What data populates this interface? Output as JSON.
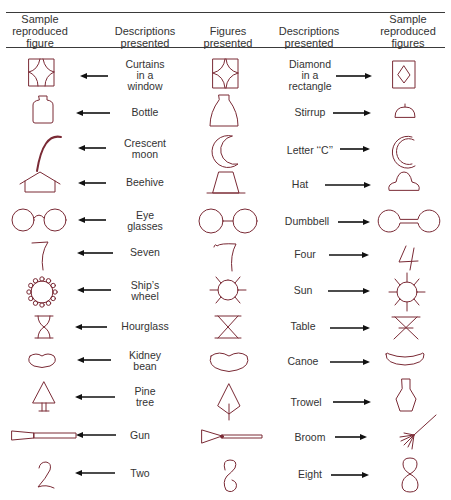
{
  "header": {
    "col1": "Sample\nreproduced\nfigure",
    "col2": "Descriptions\npresented",
    "col3": "Figures\npresented",
    "col4": "Descriptions\npresented",
    "col5": "Sample\nreproduced\nfigures"
  },
  "colors": {
    "figure_stroke": "#7a2a35",
    "arrow": "#111111",
    "rule": "#3a3a3a"
  },
  "rows": [
    {
      "left_desc": "Curtains\nin a\nwindow",
      "figure": "curtains-window-figure",
      "left_reproduced": "curtains-in-window",
      "right_desc": "Diamond\nin a\nrectangle",
      "right_reproduced": "diamond-in-rectangle"
    },
    {
      "left_desc": "Bottle",
      "figure": "flask-figure",
      "left_reproduced": "bottle",
      "right_desc": "Stirrup",
      "right_reproduced": "stirrup"
    },
    {
      "left_desc": "Crescent\nmoon",
      "figure": "crescent-figure",
      "left_reproduced": "crescent-moon",
      "right_desc": "Letter ‘‘C’’",
      "right_reproduced": "letter-c"
    },
    {
      "left_desc": "Beehive",
      "figure": "trapezoid-figure",
      "left_reproduced": "beehive",
      "right_desc": "Hat",
      "right_reproduced": "hat"
    },
    {
      "left_desc": "Eye\nglasses",
      "figure": "two-circles-figure",
      "left_reproduced": "eye-glasses",
      "right_desc": "Dumbbell",
      "right_reproduced": "dumbbell"
    },
    {
      "left_desc": "Seven",
      "figure": "seven-figure",
      "left_reproduced": "seven",
      "right_desc": "Four",
      "right_reproduced": "four"
    },
    {
      "left_desc": "Ship’s\nwheel",
      "figure": "sun-figure",
      "left_reproduced": "ships-wheel",
      "right_desc": "Sun",
      "right_reproduced": "sun"
    },
    {
      "left_desc": "Hourglass",
      "figure": "hourglass-figure",
      "left_reproduced": "hourglass",
      "right_desc": "Table",
      "right_reproduced": "table"
    },
    {
      "left_desc": "Kidney\nbean",
      "figure": "bean-figure",
      "left_reproduced": "kidney-bean",
      "right_desc": "Canoe",
      "right_reproduced": "canoe"
    },
    {
      "left_desc": "Pine\ntree",
      "figure": "kite-figure",
      "left_reproduced": "pine-tree",
      "right_desc": "Trowel",
      "right_reproduced": "trowel"
    },
    {
      "left_desc": "Gun",
      "figure": "wedge-rod-figure",
      "left_reproduced": "gun",
      "right_desc": "Broom",
      "right_reproduced": "broom"
    },
    {
      "left_desc": "Two",
      "figure": "s-curve-figure",
      "left_reproduced": "two",
      "right_desc": "Eight",
      "right_reproduced": "eight"
    }
  ]
}
